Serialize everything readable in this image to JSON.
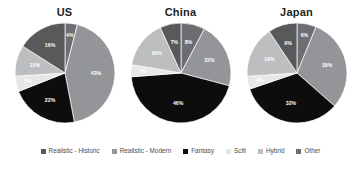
{
  "chart_data": {
    "type": "pie",
    "title": "",
    "charts": [
      {
        "title": "US",
        "labels": [
          "Other",
          "Realistic - Modern",
          "Fantasy",
          "Scifi",
          "Hybrid",
          "Realistic - Historic"
        ],
        "values": [
          4,
          43,
          22,
          5,
          10,
          16
        ],
        "value_labels": [
          "4%",
          "43%",
          "22%",
          "5%",
          "10%",
          "16%"
        ]
      },
      {
        "title": "China",
        "labels": [
          "Other",
          "Realistic - Modern",
          "Fantasy",
          "Scifi",
          "Hybrid",
          "Realistic - Historic"
        ],
        "values": [
          8,
          22,
          46,
          4,
          16,
          7
        ],
        "value_labels": [
          "8%",
          "22%",
          "46%",
          "4%",
          "16%",
          "7%"
        ]
      },
      {
        "title": "Japan",
        "labels": [
          "Other",
          "Realistic - Modern",
          "Fantasy",
          "Scifi",
          "Hybrid",
          "Realistic - Historic"
        ],
        "values": [
          6,
          29,
          32,
          4,
          16,
          9
        ],
        "value_labels": [
          "6%",
          "29%",
          "32%",
          "4%",
          "16%",
          "9%"
        ]
      }
    ],
    "legend": {
      "position": "bottom",
      "entries": [
        {
          "label": "Realistic - Historic",
          "color": "#58595b"
        },
        {
          "label": "Realistic - Modern",
          "color": "#939598"
        },
        {
          "label": "Fantasy",
          "color": "#0d0d0d"
        },
        {
          "label": "Scifi",
          "color": "#e6e7e8"
        },
        {
          "label": "Hybrid",
          "color": "#bcbec0"
        },
        {
          "label": "Other",
          "color": "#6d6e71"
        }
      ]
    },
    "colors": {
      "realistic_historic": "#58595b",
      "realistic_modern": "#939598",
      "fantasy": "#0d0d0d",
      "scifi": "#e6e7e8",
      "hybrid": "#bcbec0",
      "other": "#6d6e71",
      "background": "#ffffff",
      "title_text": "#231f20",
      "legend_text": "#4d4d4f",
      "slice_label_text": "#ffffff"
    }
  }
}
